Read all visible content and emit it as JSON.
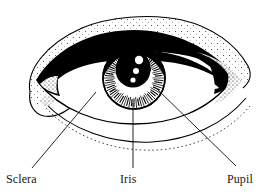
{
  "figure": {
    "kind": "anatomical-line-art",
    "style": "black and white stippled engraving",
    "background_color": "#ffffff",
    "ink_color": "#000000"
  },
  "labels": [
    {
      "id": "sclera",
      "text": "Sclera",
      "x": 6,
      "y": 173,
      "leader": {
        "from_x": 96,
        "from_y": 92,
        "to_x": 32,
        "to_y": 168
      }
    },
    {
      "id": "iris",
      "text": "Iris",
      "x": 120,
      "y": 173,
      "leader": {
        "from_x": 133,
        "from_y": 103,
        "to_x": 133,
        "to_y": 168
      }
    },
    {
      "id": "pupil",
      "text": "Pupil",
      "x": 227,
      "y": 173,
      "leader": {
        "from_x": 156,
        "from_y": 88,
        "to_x": 236,
        "to_y": 166
      }
    }
  ],
  "anatomy": {
    "iris": {
      "center_x": 134,
      "center_y": 78,
      "radius": 31
    },
    "pupil": {
      "center_x": 133,
      "center_y": 70,
      "radius": 17
    },
    "highlights": [
      {
        "cx": 139,
        "cy": 60,
        "r": 4.2
      },
      {
        "cx": 136,
        "cy": 71,
        "r": 3.0
      },
      {
        "cx": 133,
        "cy": 80,
        "r": 2.6
      }
    ],
    "eye_opening": {
      "left_x": 38,
      "right_x": 232,
      "center_y": 80
    },
    "striation_count": 72
  }
}
